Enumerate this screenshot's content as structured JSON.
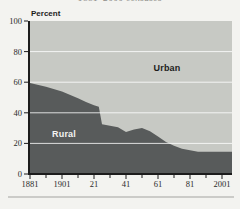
{
  "page": {
    "clipped_title_fragment": "1881–2000 censuses"
  },
  "chart": {
    "axis_title": "Percent",
    "urban_label": "Urban",
    "rural_label": "Rural"
  },
  "chart_data": {
    "type": "area",
    "stacked": true,
    "title": "1881–2000 censuses",
    "title_note": "title clipped at top edge of image, only bottom of glyphs visible",
    "ylabel": "Percent",
    "ylim": [
      0,
      100
    ],
    "y_ticks": [
      0,
      20,
      40,
      60,
      80,
      100
    ],
    "gridlines_at": [
      20,
      40,
      60,
      80
    ],
    "grid": true,
    "x_range_years": [
      1881,
      2001
    ],
    "x_major_ticks": [
      {
        "year": 1881,
        "label": "1881"
      },
      {
        "year": 1901,
        "label": "1901"
      },
      {
        "year": 1921,
        "label": "21"
      },
      {
        "year": 1941,
        "label": "41"
      },
      {
        "year": 1961,
        "label": "61"
      },
      {
        "year": 1981,
        "label": "81"
      },
      {
        "year": 2001,
        "label": "2001"
      }
    ],
    "x_minor_ticks": [
      1891,
      1911,
      1931,
      1951,
      1971,
      1991
    ],
    "legend_position": "labels-inside-areas",
    "series": [
      {
        "name": "Rural",
        "color": "#585b5b",
        "points": [
          [
            1881,
            59.5
          ],
          [
            1891,
            57
          ],
          [
            1901,
            54
          ],
          [
            1911,
            49.5
          ],
          [
            1916,
            47
          ],
          [
            1921,
            45
          ],
          [
            1924,
            44
          ],
          [
            1926,
            32.5
          ],
          [
            1931,
            31.5
          ],
          [
            1936,
            30.5
          ],
          [
            1941,
            27.5
          ],
          [
            1946,
            29
          ],
          [
            1951,
            30
          ],
          [
            1956,
            28
          ],
          [
            1961,
            24.5
          ],
          [
            1966,
            21
          ],
          [
            1971,
            18.5
          ],
          [
            1976,
            16.5
          ],
          [
            1981,
            15.5
          ],
          [
            1986,
            14.5
          ],
          [
            1991,
            14.5
          ],
          [
            2001,
            14.5
          ]
        ]
      },
      {
        "name": "Urban",
        "color": "#c7c9c4",
        "note": "remainder to 100 percent, drawn as plot background"
      }
    ]
  },
  "colors": {
    "page_bg": "#f3f3f0",
    "urban_area": "#c7c9c4",
    "rural_area": "#585b5b",
    "gridline": "#ffffff",
    "axis": "#1c1c1c",
    "tick_label": "#2a2a2a",
    "divider": "#a3a3a0",
    "clipped_title_text": "#8e8e8a"
  }
}
